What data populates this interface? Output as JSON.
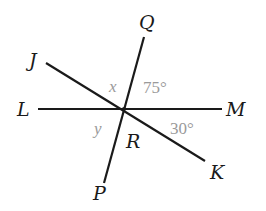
{
  "diagram": {
    "type": "intersecting-lines",
    "intersection": {
      "name": "R",
      "x": 124,
      "y": 109
    },
    "lines": [
      {
        "name": "LM",
        "from": "L",
        "to": "M",
        "x1": 38,
        "y1": 109,
        "x2": 222,
        "y2": 109
      },
      {
        "name": "QP",
        "from": "Q",
        "to": "P",
        "x1": 144,
        "y1": 37,
        "x2": 104,
        "y2": 183
      },
      {
        "name": "JK",
        "from": "J",
        "to": "K",
        "x1": 46,
        "y1": 63,
        "x2": 205,
        "y2": 161
      }
    ],
    "points": {
      "J": "J",
      "Q": "Q",
      "L": "L",
      "M": "M",
      "R": "R",
      "P": "P",
      "K": "K"
    },
    "angles": {
      "x": "x",
      "angle_QRM": "75°",
      "y": "y",
      "angle_MRK": "30°"
    },
    "colors": {
      "lines": "#1a1a1a",
      "point_labels": "#1a1a1a",
      "angle_labels": "#9a9a9a",
      "background": "#ffffff"
    }
  }
}
